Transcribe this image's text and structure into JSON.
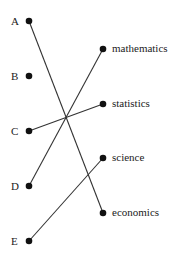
{
  "diagram": {
    "left_nodes": [
      {
        "id": "A",
        "label": "A",
        "x": 29,
        "y": 21
      },
      {
        "id": "B",
        "label": "B",
        "x": 29,
        "y": 76
      },
      {
        "id": "C",
        "label": "C",
        "x": 29,
        "y": 131
      },
      {
        "id": "D",
        "label": "D",
        "x": 29,
        "y": 186
      },
      {
        "id": "E",
        "label": "E",
        "x": 29,
        "y": 241
      }
    ],
    "right_nodes": [
      {
        "id": "mathematics",
        "label": "mathematics",
        "x": 103,
        "y": 49
      },
      {
        "id": "statistics",
        "label": "statistics",
        "x": 103,
        "y": 104
      },
      {
        "id": "science",
        "label": "science",
        "x": 103,
        "y": 158
      },
      {
        "id": "economics",
        "label": "economics",
        "x": 103,
        "y": 213
      }
    ],
    "edges": [
      {
        "from": "A",
        "to": "economics"
      },
      {
        "from": "C",
        "to": "statistics"
      },
      {
        "from": "D",
        "to": "mathematics"
      },
      {
        "from": "E",
        "to": "science"
      }
    ],
    "colors": {
      "line": "#333333",
      "dot": "#111111",
      "text": "#222222"
    }
  }
}
